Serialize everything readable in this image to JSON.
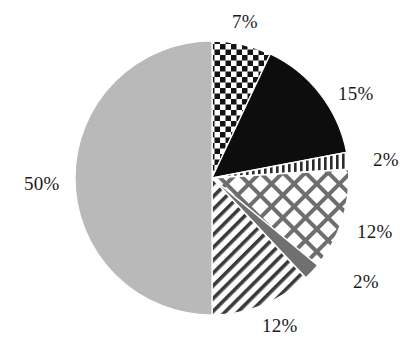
{
  "chart_data": {
    "type": "pie",
    "title": "",
    "subtitle": "",
    "xlabel": "",
    "ylabel": "",
    "legend": "none",
    "grid": false,
    "labels_show_percent": true,
    "start_angle_deg": 0,
    "direction": "clockwise",
    "categories": [
      "Segment 1",
      "Segment 2",
      "Segment 3",
      "Segment 4",
      "Segment 5",
      "Segment 6",
      "Segment 7"
    ],
    "values": [
      7,
      15,
      2,
      12,
      2,
      12,
      50
    ],
    "data_labels": [
      "7%",
      "15%",
      "2%",
      "12%",
      "2%",
      "12%",
      "50%"
    ],
    "slices": [
      {
        "label": "7%",
        "value": 7,
        "fill_style": "checkerboard",
        "fill_color": "#1a1a1a",
        "background_color": "#ffffff",
        "start_pct": 0,
        "end_pct": 7
      },
      {
        "label": "15%",
        "value": 15,
        "fill_style": "solid",
        "fill_color": "#0d0d0d",
        "background_color": "#0d0d0d",
        "start_pct": 7,
        "end_pct": 22
      },
      {
        "label": "2%",
        "value": 2,
        "fill_style": "vertical-lines",
        "fill_color": "#2b2b2b",
        "background_color": "#ffffff",
        "start_pct": 22,
        "end_pct": 24
      },
      {
        "label": "12%",
        "value": 12,
        "fill_style": "diagonal-crosshatch",
        "fill_color": "#6e6e6e",
        "background_color": "#ffffff",
        "start_pct": 24,
        "end_pct": 36
      },
      {
        "label": "2%",
        "value": 2,
        "fill_style": "solid",
        "fill_color": "#707070",
        "background_color": "#707070",
        "start_pct": 36,
        "end_pct": 38
      },
      {
        "label": "12%",
        "value": 12,
        "fill_style": "diagonal-lines",
        "fill_color": "#404040",
        "background_color": "#ffffff",
        "start_pct": 38,
        "end_pct": 50
      },
      {
        "label": "50%",
        "value": 50,
        "fill_style": "solid",
        "fill_color": "#b9b9b9",
        "background_color": "#b9b9b9",
        "start_pct": 50,
        "end_pct": 100
      }
    ],
    "geometry": {
      "center_x": 212,
      "center_y": 178,
      "radius": 137
    },
    "label_positions": [
      {
        "text": "7%",
        "x": 232,
        "y": 12
      },
      {
        "text": "15%",
        "x": 338,
        "y": 84
      },
      {
        "text": "2%",
        "x": 373,
        "y": 150
      },
      {
        "text": "12%",
        "x": 357,
        "y": 222
      },
      {
        "text": "2%",
        "x": 353,
        "y": 272
      },
      {
        "text": "12%",
        "x": 262,
        "y": 316
      },
      {
        "text": "50%",
        "x": 24,
        "y": 174
      }
    ]
  },
  "figure": {
    "background_color": "#ffffff",
    "width": 416,
    "height": 354
  }
}
